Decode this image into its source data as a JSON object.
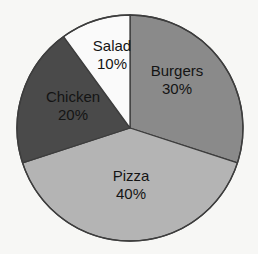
{
  "background_color": "#f7f7f5",
  "chart_data": {
    "type": "pie",
    "title": "",
    "subtitle": "",
    "xlabel": "",
    "ylabel": "",
    "grid": false,
    "legend_position": "none",
    "labels_inside_slices": true,
    "value_suffix": "%",
    "start_angle_deg": 0,
    "direction": "clockwise",
    "center": {
      "x": 130,
      "y": 128
    },
    "radius": 113,
    "categories": [
      "Burgers",
      "Pizza",
      "Chicken",
      "Salad"
    ],
    "values": [
      30,
      40,
      20,
      10
    ],
    "slices": [
      {
        "label": "Burgers",
        "value": 30,
        "value_text": "30%",
        "color": "#8a8a8a",
        "start_angle_deg": 0,
        "end_angle_deg": 108,
        "label_x": 177,
        "label_y": 76,
        "value_x": 177,
        "value_y": 94
      },
      {
        "label": "Pizza",
        "value": 40,
        "value_text": "40%",
        "color": "#b4b4b4",
        "start_angle_deg": 108,
        "end_angle_deg": 252,
        "label_x": 131,
        "label_y": 181,
        "value_x": 131,
        "value_y": 199
      },
      {
        "label": "Chicken",
        "value": 20,
        "value_text": "20%",
        "color": "#4a4a4a",
        "start_angle_deg": 252,
        "end_angle_deg": 324,
        "label_x": 73,
        "label_y": 102,
        "value_x": 73,
        "value_y": 120
      },
      {
        "label": "Salad",
        "value": 10,
        "value_text": "10%",
        "color": "#fafafa",
        "start_angle_deg": 324,
        "end_angle_deg": 360,
        "label_x": 112,
        "label_y": 51,
        "value_x": 112,
        "value_y": 69
      }
    ],
    "slice_border_color": "#3d3d3d",
    "label_text_color": "#141414"
  }
}
